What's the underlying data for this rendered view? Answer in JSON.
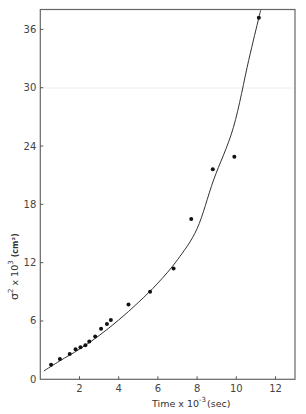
{
  "chart_data": {
    "type": "scatter",
    "title": "",
    "xlabel": "Time x 10^-3 (sec)",
    "xlabel_parts": {
      "main": "Time x 10",
      "exp": "-3",
      "unit": "(sec)"
    },
    "ylabel": "σ² x 10³ (cm²)",
    "ylabel_parts": {
      "sigma": "σ",
      "sq": "2",
      "times": "x 10",
      "exp": "3",
      "unit": "(cm²)"
    },
    "xlim": [
      0,
      13
    ],
    "ylim": [
      0,
      37.5
    ],
    "xticks": [
      2,
      4,
      6,
      8,
      10,
      12
    ],
    "yticks": [
      0,
      6,
      12,
      18,
      24,
      30,
      36
    ],
    "xtick_labels": [
      "2",
      "4",
      "6",
      "8",
      "10",
      "12"
    ],
    "ytick_labels": [
      "0",
      "6",
      "12",
      "18",
      "24",
      "30",
      "36"
    ],
    "grid": false,
    "legend": null,
    "series": [
      {
        "name": "measured",
        "kind": "points",
        "x": [
          0.55,
          1.0,
          1.5,
          1.8,
          2.05,
          2.3,
          2.5,
          2.8,
          3.1,
          3.4,
          3.6,
          4.5,
          5.6,
          6.8,
          7.7,
          8.8,
          9.9,
          11.15
        ],
        "y": [
          1.5,
          2.1,
          2.6,
          3.1,
          3.3,
          3.5,
          3.9,
          4.4,
          5.2,
          5.7,
          6.1,
          7.7,
          9.0,
          11.4,
          16.5,
          21.6,
          22.9,
          37.2
        ]
      },
      {
        "name": "fitted curve",
        "kind": "line",
        "x": [
          0.18,
          1,
          2,
          3,
          4,
          5,
          6,
          7,
          8,
          8.84,
          9.85,
          10.63,
          11.15,
          11.25
        ],
        "y": [
          0.85,
          1.9,
          3.1,
          4.5,
          6.1,
          7.9,
          9.9,
          12.3,
          15.5,
          20.5,
          25.9,
          32.8,
          37.2,
          38.0
        ]
      }
    ]
  },
  "colors": {
    "ink": "#1a1a1a",
    "axis": "#555555",
    "text": "#444444"
  }
}
